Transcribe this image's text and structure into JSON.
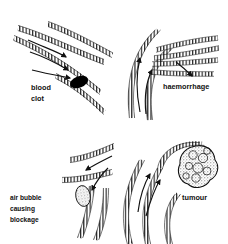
{
  "figure": {
    "background_color": "#ffffff",
    "ink_color": "#111111",
    "panel_count": 4,
    "layout": "2x2 grid"
  },
  "panels": [
    {
      "id": "blood-clot",
      "position": "top-left",
      "label": "blood",
      "label_line2": "clot",
      "lesion": "solid black thrombus occluding vessel lumen",
      "lesion_color": "#000000",
      "flow_arrows": 3,
      "flow_direction": "toward clot"
    },
    {
      "id": "haemorrhage",
      "position": "top-right",
      "label": "haemorrhage",
      "lesion": "ruptured vessel branches leaking outward",
      "flow_arrows": 2,
      "flow_direction": "upward along vessel"
    },
    {
      "id": "air-bubble",
      "position": "bottom-left",
      "label": "air bubble",
      "label_line2": "causing",
      "label_line3": "blockage",
      "lesion": "pale stippled oval gas embolus in lumen",
      "lesion_color": "#d8d8d8",
      "flow_arrows": 2,
      "flow_direction": "toward bubble"
    },
    {
      "id": "tumour",
      "position": "bottom-right",
      "label": "tumour",
      "lesion": "lobulated stippled mass compressing vessel",
      "lesion_color": "#cccccc",
      "flow_arrows": 2,
      "flow_direction": "upward toward mass"
    }
  ]
}
